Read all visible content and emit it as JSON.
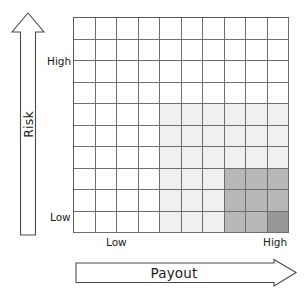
{
  "figure": {
    "type": "risk-payout-matrix",
    "background": "#ffffff"
  },
  "y_axis": {
    "name": "Risk",
    "label": "Risk",
    "arrow_direction": "up",
    "arrow_icon": "arrow-up-icon",
    "high_tick": "High",
    "low_tick": "Low"
  },
  "x_axis": {
    "name": "Payout",
    "label": "Payout",
    "arrow_direction": "right",
    "arrow_icon": "arrow-right-icon",
    "low_tick": "Low",
    "high_tick": "High"
  },
  "chart_data": {
    "type": "heatmap",
    "title": "",
    "subtitle": "",
    "xlabel": "Payout",
    "ylabel": "Risk",
    "xlim": [
      0,
      10
    ],
    "ylim": [
      0,
      10
    ],
    "grid": true,
    "legend": "none",
    "rows": 10,
    "cols": 10,
    "x_tick_labels": [
      "Low",
      "High"
    ],
    "y_tick_labels": [
      "Low",
      "High"
    ],
    "x_tick_positions": [
      1.5,
      9.5
    ],
    "y_tick_positions": [
      0.5,
      7.5
    ],
    "colors": {
      "empty": "#ffffff",
      "light": "#f0f0f0",
      "medium": "#b8b8b8",
      "dark": "#989898",
      "gridline": "#6e6e6e",
      "border": "#5a5a5a",
      "text": "#1a1a1a"
    },
    "value_levels": {
      "0": "empty",
      "1": "light",
      "2": "medium",
      "3": "dark"
    },
    "note": "values[r][c]; row 0 = top (highest Risk), row 9 = bottom (lowest Risk); col 0 = left (lowest Payout), col 9 = right (highest Payout)",
    "values": [
      [
        0,
        0,
        0,
        0,
        0,
        0,
        0,
        0,
        0,
        0
      ],
      [
        0,
        0,
        0,
        0,
        0,
        0,
        0,
        0,
        0,
        0
      ],
      [
        0,
        0,
        0,
        0,
        0,
        0,
        0,
        0,
        0,
        0
      ],
      [
        0,
        0,
        0,
        0,
        0,
        0,
        0,
        0,
        0,
        0
      ],
      [
        0,
        0,
        0,
        0,
        1,
        1,
        1,
        1,
        1,
        1
      ],
      [
        0,
        0,
        0,
        0,
        1,
        1,
        1,
        1,
        1,
        1
      ],
      [
        0,
        0,
        0,
        0,
        1,
        1,
        1,
        1,
        1,
        1
      ],
      [
        0,
        0,
        0,
        0,
        1,
        1,
        1,
        2,
        2,
        2
      ],
      [
        0,
        0,
        0,
        0,
        1,
        1,
        1,
        2,
        2,
        2
      ],
      [
        0,
        0,
        0,
        0,
        1,
        1,
        1,
        2,
        2,
        3
      ]
    ]
  }
}
